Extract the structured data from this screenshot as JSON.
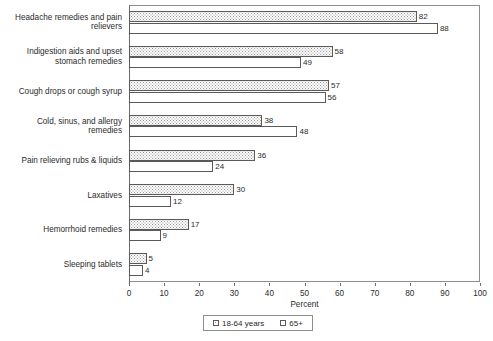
{
  "chart_data": {
    "type": "bar",
    "orientation": "horizontal",
    "title": "",
    "xlabel": "Percent",
    "ylabel": "",
    "xlim": [
      0,
      100
    ],
    "xticks": [
      0,
      10,
      20,
      30,
      40,
      50,
      60,
      70,
      80,
      90,
      100
    ],
    "grid": false,
    "legend_position": "bottom-center",
    "categories": [
      "Headache remedies and pain relievers",
      "Indigestion aids and upset stomach remedies",
      "Cough drops or cough syrup",
      "Cold, sinus, and allergy remedies",
      "Pain relieving rubs & liquids",
      "Laxatives",
      "Hemorrhoid remedies",
      "Sleeping tablets"
    ],
    "series": [
      {
        "name": "18-64 years",
        "values": [
          82,
          58,
          57,
          38,
          36,
          30,
          17,
          5
        ]
      },
      {
        "name": "65+",
        "values": [
          88,
          49,
          56,
          48,
          24,
          12,
          9,
          4
        ]
      }
    ]
  },
  "legend": {
    "items": [
      {
        "label": "18-64 years"
      },
      {
        "label": "65+"
      }
    ]
  },
  "colors": {
    "bar_outline": "#5a5a5a",
    "frame": "#8d8d8d",
    "text": "#2b2b2b",
    "background": "#ffffff"
  }
}
